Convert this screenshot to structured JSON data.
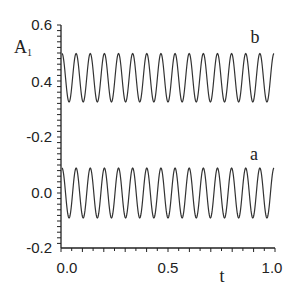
{
  "chart_data": {
    "type": "line",
    "title": "",
    "xlabel": "t",
    "ylabel": "A",
    "ylabel_subscript": "1",
    "xlim": [
      0.0,
      1.0
    ],
    "x_ticks": [
      "0.0",
      "0.5",
      "1.0"
    ],
    "y_tick_labels": [
      {
        "label": "0.6",
        "segment": "upper"
      },
      {
        "label": "0.4",
        "segment": "upper"
      },
      {
        "label": "-0.2",
        "segment": "break"
      },
      {
        "label": "0.0",
        "segment": "lower"
      },
      {
        "label": "-0.2",
        "segment": "lower"
      }
    ],
    "axis_note": "Broken y-axis: upper segment shows ~0.3-0.6 (curve b), lower segment shows -0.2-0.1 (curve a)",
    "grid": false,
    "legend": "inline labels",
    "series": [
      {
        "name": "b",
        "description": "sinusoidal oscillation",
        "center": 0.415,
        "amplitude": 0.085,
        "min": 0.33,
        "max": 0.5,
        "cycles": 15,
        "phase": "starts near maximum"
      },
      {
        "name": "a",
        "description": "sinusoidal oscillation",
        "center": 0.0,
        "amplitude": 0.09,
        "min": -0.09,
        "max": 0.09,
        "cycles": 15,
        "phase": "starts near maximum"
      }
    ]
  },
  "labels": {
    "x_axis_title": "t",
    "y_axis_title": "A",
    "y_axis_subscript": "1",
    "curve_b": "b",
    "curve_a": "a",
    "x_tick_0": "0.0",
    "x_tick_1": "0.5",
    "x_tick_2": "1.0",
    "y_tick_0": "0.6",
    "y_tick_1": "0.4",
    "y_tick_2": "-0.2",
    "y_tick_3": "0.0",
    "y_tick_4": "-0.2"
  }
}
